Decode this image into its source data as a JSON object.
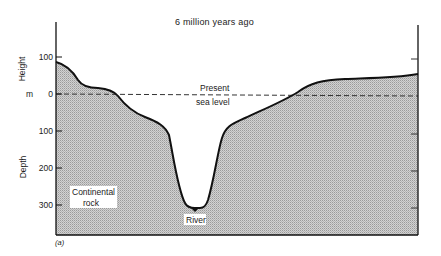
{
  "figure": {
    "title": "6 million years ago",
    "panel_label": "(a)",
    "y_axis": {
      "upper_label": "Height",
      "unit_label": "m",
      "lower_label": "Depth",
      "ticks": [
        {
          "label": "100",
          "value": 100
        },
        {
          "label": "0",
          "value": 0
        },
        {
          "label": "100",
          "value": -100
        },
        {
          "label": "200",
          "value": -200
        },
        {
          "label": "300",
          "value": -300
        }
      ]
    },
    "annotations": {
      "sea_level_line1": "Present",
      "sea_level_line2": "sea level",
      "rock_line1": "Continental",
      "rock_line2": "rock",
      "river": "River"
    },
    "colors": {
      "rock_fill": "#c8c8c8",
      "outline": "#111111",
      "sea_level_dash": "#333333"
    },
    "profile_description": "Cross-section of a deep canyon cut into continental rock, with the river at the bottom around 300 m below present sea level; land rises to about 80 m on the left and about 45 m on the right."
  }
}
